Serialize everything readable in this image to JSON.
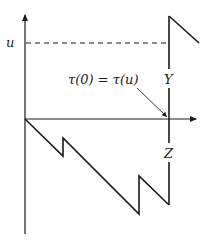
{
  "diagram": {
    "labels": {
      "u_level": "u",
      "tau_equation": "τ(0) = τ(u)",
      "jump_above": "Y",
      "jump_below": "Z"
    },
    "colors": {
      "stroke": "#1a1a1a",
      "background": "#ffffff"
    }
  }
}
